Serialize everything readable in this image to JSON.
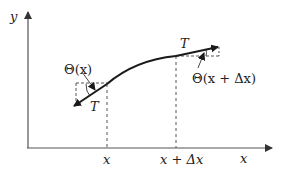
{
  "diagram": {
    "axes": {
      "x_label": "x",
      "y_label": "y"
    },
    "ticks": {
      "left": "x",
      "right": "x + Δx"
    },
    "angles": {
      "left": "Θ(x)",
      "right": "Θ(x + Δx)"
    },
    "forces": {
      "left_tension": "T",
      "right_tension": "T"
    },
    "colors": {
      "line": "#1a1a1a",
      "axis": "#555555",
      "dashed": "#555555"
    }
  }
}
